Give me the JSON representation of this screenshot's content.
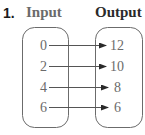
{
  "problem": {
    "number": "1.",
    "input_header": "Input",
    "output_header": "Output"
  },
  "mapping": {
    "inputs": [
      "0",
      "2",
      "4",
      "6"
    ],
    "outputs": [
      "12",
      "10",
      "8",
      "6"
    ],
    "pairs": [
      {
        "input": "0",
        "output": "12"
      },
      {
        "input": "2",
        "output": "10"
      },
      {
        "input": "4",
        "output": "8"
      },
      {
        "input": "6",
        "output": "6"
      }
    ]
  },
  "colors": {
    "stroke": "#6b6b6b",
    "text": "#6b6b6b",
    "label": "#1a1a1a"
  }
}
